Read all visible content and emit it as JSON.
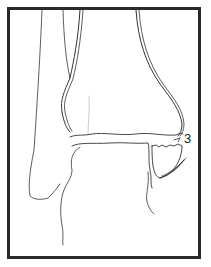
{
  "figure": {
    "labels": [
      {
        "id": "fragment-3",
        "text": "3"
      }
    ],
    "colors": {
      "line": "#333333",
      "frame": "#2a2a2a",
      "background": "#ffffff"
    }
  }
}
